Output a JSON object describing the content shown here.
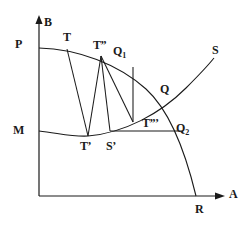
{
  "figure": {
    "stroke_color": "#1a1a1a",
    "background_color": "#ffffff",
    "axes": {
      "vertical_label": "B",
      "horizontal_label": "A",
      "origin_x": 39,
      "origin_y": 196
    },
    "labels": [
      {
        "name": "axis-label-b",
        "text": "B",
        "sub": "",
        "x": 44,
        "y": 16
      },
      {
        "name": "axis-label-a",
        "text": "A",
        "sub": "",
        "x": 229,
        "y": 188
      },
      {
        "name": "point-label-p",
        "text": "P",
        "sub": "",
        "x": 15,
        "y": 38
      },
      {
        "name": "point-label-m",
        "text": "M",
        "sub": "",
        "x": 13,
        "y": 124
      },
      {
        "name": "point-label-t",
        "text": "T",
        "sub": "",
        "x": 63,
        "y": 31
      },
      {
        "name": "point-label-t2",
        "text": "T”",
        "sub": "",
        "x": 93,
        "y": 39
      },
      {
        "name": "point-label-q1",
        "text": "Q",
        "sub": "1",
        "x": 113,
        "y": 45
      },
      {
        "name": "point-label-s",
        "text": "S",
        "sub": "",
        "x": 212,
        "y": 44
      },
      {
        "name": "point-label-q",
        "text": "Q",
        "sub": "",
        "x": 160,
        "y": 83
      },
      {
        "name": "point-label-t3",
        "text": "T”’",
        "sub": "",
        "x": 142,
        "y": 117
      },
      {
        "name": "point-label-q2",
        "text": "Q",
        "sub": "2",
        "x": 176,
        "y": 122
      },
      {
        "name": "point-label-tprime",
        "text": "T’",
        "sub": "",
        "x": 80,
        "y": 140
      },
      {
        "name": "point-label-sprime",
        "text": "S’",
        "sub": "",
        "x": 106,
        "y": 140
      },
      {
        "name": "point-label-r",
        "text": "R",
        "sub": "",
        "x": 195,
        "y": 203
      }
    ],
    "curves": {
      "production_possibility_curve_pr": "M39,48 C 78,49 118,64 146,89 C 168,109 184,146 196,196",
      "substitution_curve_ms": "M39,131 C 58,133 72,137 88,136 C 124,133 160,114 186,88 C 198,76 206,68 214,58",
      "horizontal_baseline_t3_q2": {
        "x1": 110,
        "y1": 131,
        "x2": 183,
        "y2": 131
      }
    },
    "chords": [
      {
        "name": "chord-t-tprime",
        "x1": 67,
        "y1": 49,
        "x2": 88,
        "y2": 136
      },
      {
        "name": "chord-t2-tprime",
        "x1": 101,
        "y1": 56,
        "x2": 88,
        "y2": 136
      },
      {
        "name": "chord-t2-sprime",
        "x1": 101,
        "y1": 56,
        "x2": 110,
        "y2": 131
      },
      {
        "name": "chord-t2-t3",
        "x1": 101,
        "y1": 56,
        "x2": 133,
        "y2": 122
      },
      {
        "name": "chord-q1-vertical",
        "x1": 133,
        "y1": 67,
        "x2": 133,
        "y2": 122
      }
    ]
  }
}
